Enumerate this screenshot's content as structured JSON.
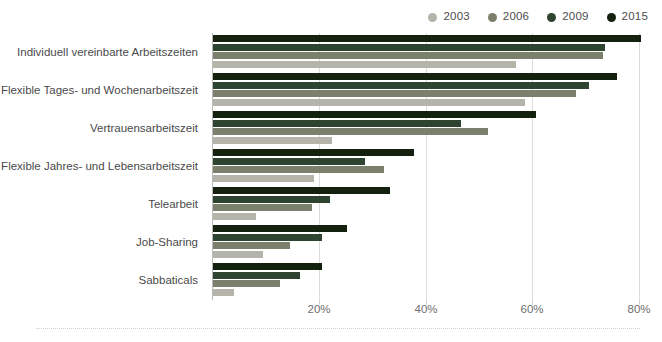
{
  "chart_data": {
    "type": "bar",
    "orientation": "horizontal",
    "title": "",
    "subtitle": "",
    "xlabel": "",
    "ylabel": "",
    "xlim": [
      0,
      82
    ],
    "ylim": null,
    "grid": "vertical",
    "legend_position": "top-right",
    "xticks": [
      20,
      40,
      60,
      80
    ],
    "xtick_labels": [
      "20%",
      "40%",
      "60%",
      "80%"
    ],
    "categories": [
      "Individuell vereinbarte Arbeitszeiten",
      "Flexible Tages- und Wochenarbeitszeit",
      "Vertrauensarbeitszeit",
      "Flexible Jahres- und Lebensarbeitszeit",
      "Telearbeit",
      "Job-Sharing",
      "Sabbaticals"
    ],
    "series": [
      {
        "name": "2003",
        "color": "#b4b4aa",
        "values": [
          56.8,
          58.5,
          22.3,
          18.9,
          8.1,
          9.4,
          4.0
        ]
      },
      {
        "name": "2006",
        "color": "#7b806c",
        "values": [
          73.0,
          68.0,
          51.5,
          32.0,
          18.5,
          14.4,
          12.5
        ]
      },
      {
        "name": "2009",
        "color": "#2f4430",
        "values": [
          73.3,
          70.4,
          46.4,
          28.5,
          21.9,
          20.4,
          16.3
        ]
      },
      {
        "name": "2015",
        "color": "#14210f",
        "values": [
          80.2,
          75.7,
          60.5,
          37.7,
          33.2,
          25.1,
          20.4
        ]
      }
    ]
  },
  "legend": {
    "items": [
      {
        "label": "2003",
        "color": "#b4b4aa"
      },
      {
        "label": "2006",
        "color": "#7b806c"
      },
      {
        "label": "2009",
        "color": "#2f4430"
      },
      {
        "label": "2015",
        "color": "#14210f"
      }
    ]
  },
  "colors": {
    "axis": "#b9b9b9",
    "grid": "#dcdcdc",
    "text": "#4a4a4a",
    "tick_text": "#6e6e6e",
    "background": "#ffffff",
    "footer_rule": "#d2d2d2"
  }
}
